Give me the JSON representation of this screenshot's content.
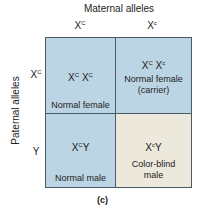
{
  "title": "Maternal alleles",
  "row_title": "Paternal alleles",
  "columns": [
    {
      "base": "X",
      "sup": "C"
    },
    {
      "base": "X",
      "sup": "c"
    }
  ],
  "rows": [
    {
      "base": "X",
      "sup": "C"
    },
    {
      "base": "Y",
      "sup": ""
    }
  ],
  "cells": [
    {
      "g1": "X",
      "s1": "C",
      "g2": " X",
      "s2": "C",
      "suffix": "",
      "phenotype": "Normal female",
      "phenotype2": "",
      "color": "#bcd5e4"
    },
    {
      "g1": "X",
      "s1": "C",
      "g2": " X",
      "s2": "c",
      "suffix": "",
      "phenotype": "Normal female",
      "phenotype2": "(carrier)",
      "color": "#bcd5e4"
    },
    {
      "g1": "X",
      "s1": "C",
      "g2": "",
      "s2": "",
      "suffix": "Y",
      "phenotype": "Normal male",
      "phenotype2": "",
      "color": "#bcd5e4"
    },
    {
      "g1": "X",
      "s1": "c",
      "g2": "",
      "s2": "",
      "suffix": "Y",
      "phenotype": "Color-blind",
      "phenotype2": "male",
      "color": "#ece8dc"
    }
  ],
  "caption": "(c)"
}
